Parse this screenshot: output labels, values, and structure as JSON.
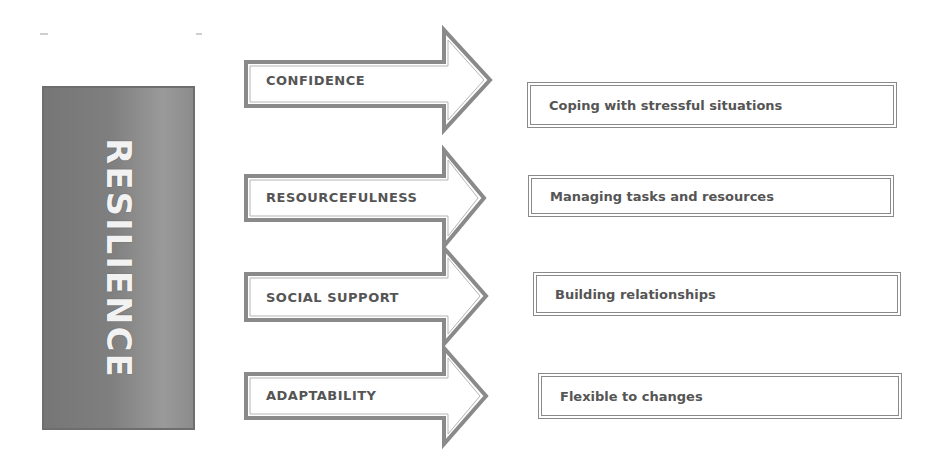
{
  "diagram": {
    "main": {
      "label": "RESILIENCE",
      "color": "#808080"
    },
    "rows": [
      {
        "factor": "CONFIDENCE",
        "description": "Coping with stressful situations"
      },
      {
        "factor": "RESOURCEFULNESS",
        "description": "Managing tasks and resources"
      },
      {
        "factor": "SOCIAL SUPPORT",
        "description": "Building relationships"
      },
      {
        "factor": "ADAPTABILITY",
        "description": "Flexible to changes"
      }
    ],
    "colors": {
      "border": "#8a8a8a",
      "text": "#555555",
      "background": "#ffffff"
    }
  }
}
